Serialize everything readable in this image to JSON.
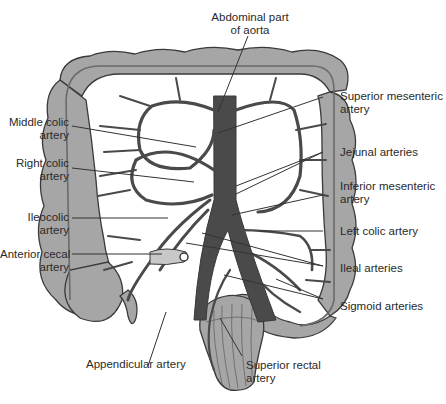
{
  "diagram": {
    "colors": {
      "colon": "#a6a6a6",
      "colon_outline": "#3a3a3a",
      "artery": "#4a4a4a",
      "mesentery": "#ffffff",
      "leader_line": "#333333",
      "text": "#2a2a2a"
    },
    "labels": {
      "top": [
        {
          "id": "abdominal-aorta",
          "text": "Abdominal part\nof aorta"
        }
      ],
      "left": [
        {
          "id": "middle-colic",
          "text": "Middle colic\nartery"
        },
        {
          "id": "right-colic",
          "text": "Right colic\nartery"
        },
        {
          "id": "ileocolic",
          "text": "Ileocolic\nartery"
        },
        {
          "id": "anterior-cecal",
          "text": "Anterior cecal\nartery"
        }
      ],
      "right": [
        {
          "id": "superior-mesenteric",
          "text": "Superior mesenteric\nartery"
        },
        {
          "id": "jejunal",
          "text": "Jejunal arteries"
        },
        {
          "id": "inferior-mesenteric",
          "text": "Inferior mesenteric\nartery"
        },
        {
          "id": "left-colic",
          "text": "Left colic artery"
        },
        {
          "id": "ileal",
          "text": "Ileal arteries"
        },
        {
          "id": "sigmoid",
          "text": "Sigmoid arteries"
        }
      ],
      "bottom": [
        {
          "id": "appendicular",
          "text": "Appendicular artery"
        },
        {
          "id": "superior-rectal",
          "text": "Superior rectal\nartery"
        }
      ]
    }
  }
}
